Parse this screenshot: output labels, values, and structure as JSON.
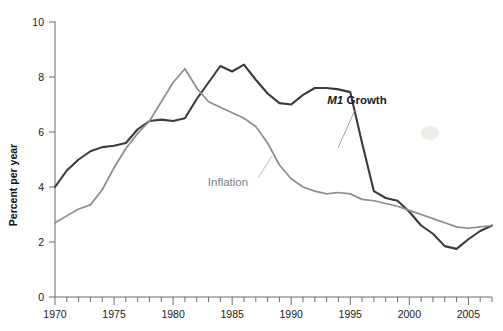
{
  "chart_data": {
    "type": "line",
    "title": "",
    "xlabel": "",
    "ylabel": "Percent per year",
    "xlim": [
      1970,
      2007
    ],
    "ylim": [
      0,
      10
    ],
    "grid": false,
    "legend_position": "inline-annotations",
    "x_ticks_major": [
      1970,
      1975,
      1980,
      1985,
      1990,
      1995,
      2000,
      2005
    ],
    "x_tick_labels": [
      "1970",
      "1975",
      "1980",
      "1985",
      "1990",
      "1995",
      "2000",
      "2005"
    ],
    "x_ticks_minor_step": 1,
    "y_ticks": [
      0,
      2,
      4,
      6,
      8,
      10
    ],
    "y_tick_labels": [
      "0",
      "2",
      "4",
      "6",
      "8",
      "10"
    ],
    "x": [
      1970,
      1971,
      1972,
      1973,
      1974,
      1975,
      1976,
      1977,
      1978,
      1979,
      1980,
      1981,
      1982,
      1983,
      1984,
      1985,
      1986,
      1987,
      1988,
      1989,
      1990,
      1991,
      1992,
      1993,
      1994,
      1995,
      1996,
      1997,
      1998,
      1999,
      2000,
      2001,
      2002,
      2003,
      2004,
      2005,
      2006,
      2007
    ],
    "series": [
      {
        "name": "M1 Growth",
        "label_markup": "M1 Growth",
        "label_italic_part": "M1",
        "label_roman_part": " Growth",
        "color": "#3b3b3b",
        "width": 2.1,
        "values": [
          4.0,
          4.6,
          5.0,
          5.3,
          5.45,
          5.5,
          5.6,
          6.1,
          6.4,
          6.45,
          6.4,
          6.5,
          7.2,
          7.8,
          8.4,
          8.2,
          8.45,
          7.9,
          7.4,
          7.05,
          7.0,
          7.35,
          7.6,
          7.6,
          7.55,
          7.45,
          5.6,
          3.85,
          3.6,
          3.5,
          3.1,
          2.6,
          2.3,
          1.85,
          1.75,
          2.1,
          2.4,
          2.6
        ]
      },
      {
        "name": "Inflation",
        "label_markup": "Inflation",
        "color": "#8d8d8d",
        "width": 1.7,
        "values": [
          2.7,
          2.95,
          3.2,
          3.35,
          3.9,
          4.7,
          5.4,
          5.95,
          6.4,
          7.1,
          7.8,
          8.3,
          7.6,
          7.1,
          6.9,
          6.7,
          6.5,
          6.2,
          5.6,
          4.8,
          4.3,
          4.0,
          3.85,
          3.75,
          3.8,
          3.75,
          3.55,
          3.5,
          3.4,
          3.3,
          3.15,
          3.0,
          2.85,
          2.7,
          2.55,
          2.5,
          2.55,
          2.6
        ]
      }
    ],
    "annotations": [
      {
        "name": "m1-growth-label",
        "text": "M1 Growth",
        "x_px": 357,
        "y_px": 104,
        "leader_from_x_px": 355,
        "leader_from_y_px": 110,
        "leader_to_x_px": 338,
        "leader_to_y_px": 148,
        "color": "#1d1d1d"
      },
      {
        "name": "inflation-label",
        "text": "Inflation",
        "x_px": 228,
        "y_px": 186,
        "leader_from_x_px": 258,
        "leader_from_y_px": 178,
        "leader_to_x_px": 272,
        "leader_to_y_px": 156,
        "color": "#7d7d7d"
      }
    ]
  },
  "axes": {
    "y_title": "Percent per year"
  }
}
